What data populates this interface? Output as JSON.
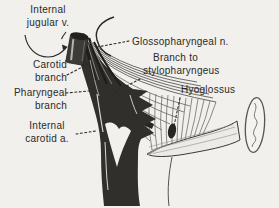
{
  "figure": {
    "type": "anatomical line drawing",
    "colors": {
      "background": "#f1f0ed",
      "ink": "#2b2a28",
      "artery_fill": "#312f2c",
      "muscle_line": "#5d5b57",
      "highlight": "#d9d7d3"
    },
    "labels": [
      {
        "id": "internal-jugular-vein",
        "lines": [
          "Internal",
          "jugular v."
        ]
      },
      {
        "id": "glossopharyngeal-nerve",
        "lines": [
          "Glossopharyngeal n."
        ]
      },
      {
        "id": "carotid-branch",
        "lines": [
          "Carotid",
          "branch"
        ]
      },
      {
        "id": "branch-to-stylopharyngeus",
        "lines": [
          "Branch to",
          "stylopharyngeus"
        ]
      },
      {
        "id": "hyoglossus",
        "lines": [
          "Hyoglossus"
        ]
      },
      {
        "id": "pharyngeal-branch",
        "lines": [
          "Pharyngeal",
          "branch"
        ]
      },
      {
        "id": "internal-carotid-artery",
        "lines": [
          "Internal",
          "carotid a."
        ]
      }
    ],
    "signature": "illegible artist signature (vertical cursive in oval)"
  }
}
